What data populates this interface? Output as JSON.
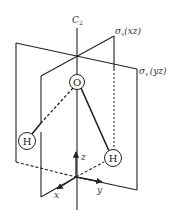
{
  "diagram": {
    "axis_label_main": "C",
    "axis_label_sub": "2",
    "plane1_label": "σ",
    "plane1_sub": "v",
    "plane1_paren": "(xz)",
    "plane2_label": "σ",
    "plane2_sub": "v",
    "plane2_prime": "′",
    "plane2_paren": "(yz)",
    "atoms": {
      "oxygen": "O",
      "hydrogen_left": "H",
      "hydrogen_right": "H"
    },
    "axes": {
      "x": "x",
      "y": "y",
      "z": "z"
    },
    "colors": {
      "line": "#222222",
      "background": "#ffffff"
    }
  }
}
